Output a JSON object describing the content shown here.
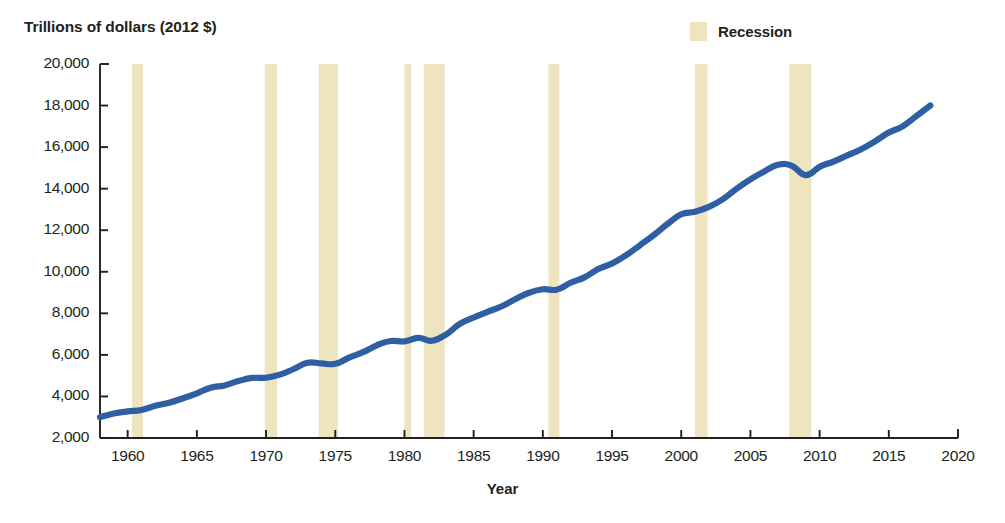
{
  "chart_data": {
    "type": "line",
    "title": "",
    "ylabel": "Trillions of dollars (2012 $)",
    "xlabel": "Year",
    "ylim": [
      2000,
      20000
    ],
    "xlim": [
      1958,
      2020
    ],
    "ytick_labels": [
      "2,000",
      "4,000",
      "6,000",
      "8,000",
      "10,000",
      "12,000",
      "14,000",
      "16,000",
      "18,000",
      "20,000"
    ],
    "ytick_values": [
      2000,
      4000,
      6000,
      8000,
      10000,
      12000,
      14000,
      16000,
      18000,
      20000
    ],
    "xtick_labels": [
      "1960",
      "1965",
      "1970",
      "1975",
      "1980",
      "1985",
      "1990",
      "1995",
      "2000",
      "2005",
      "2010",
      "2015",
      "2020"
    ],
    "xtick_values": [
      1960,
      1965,
      1970,
      1975,
      1980,
      1985,
      1990,
      1995,
      2000,
      2005,
      2010,
      2015,
      2020
    ],
    "grid": false,
    "legend_position": "top-right",
    "legend": [
      {
        "label": "Recession",
        "color": "#efe4c0",
        "type": "band"
      }
    ],
    "series": [
      {
        "name": "Real GDP",
        "color": "#2e5fa3",
        "x": [
          1958,
          1959,
          1960,
          1961,
          1962,
          1963,
          1964,
          1965,
          1966,
          1967,
          1968,
          1969,
          1970,
          1971,
          1972,
          1973,
          1974,
          1975,
          1976,
          1977,
          1978,
          1979,
          1980,
          1981,
          1982,
          1983,
          1984,
          1985,
          1986,
          1987,
          1988,
          1989,
          1990,
          1991,
          1992,
          1993,
          1994,
          1995,
          1996,
          1997,
          1998,
          1999,
          2000,
          2001,
          2002,
          2003,
          2004,
          2005,
          2006,
          2007,
          2008,
          2009,
          2010,
          2011,
          2012,
          2013,
          2014,
          2015,
          2016,
          2017,
          2018
        ],
        "values": [
          3000,
          3180,
          3280,
          3350,
          3550,
          3700,
          3910,
          4150,
          4420,
          4530,
          4740,
          4890,
          4900,
          5050,
          5320,
          5620,
          5590,
          5570,
          5870,
          6130,
          6460,
          6670,
          6650,
          6820,
          6680,
          6980,
          7490,
          7800,
          8070,
          8330,
          8680,
          8990,
          9160,
          9140,
          9470,
          9730,
          10130,
          10400,
          10790,
          11270,
          11760,
          12300,
          12770,
          12890,
          13120,
          13490,
          14000,
          14450,
          14830,
          15150,
          15100,
          14650,
          15050,
          15300,
          15600,
          15900,
          16280,
          16700,
          17000,
          17500,
          18000
        ],
        "value_start": 3000,
        "value_end": 18700,
        "peak_2007": 15750,
        "trough_2009": 15250
      }
    ],
    "recession_bands": [
      {
        "start": 1960.3,
        "end": 1961.1
      },
      {
        "start": 1969.9,
        "end": 1970.8
      },
      {
        "start": 1973.8,
        "end": 1975.2
      },
      {
        "start": 1980.0,
        "end": 1980.5
      },
      {
        "start": 1981.4,
        "end": 1982.9
      },
      {
        "start": 1990.4,
        "end": 1991.2
      },
      {
        "start": 2001.0,
        "end": 2001.9
      },
      {
        "start": 2007.8,
        "end": 2009.4
      }
    ],
    "colors": {
      "line": "#2e5fa3",
      "recession_band": "#efe4c0",
      "axis": "#231f20",
      "background": "#ffffff",
      "text": "#231f20"
    }
  }
}
